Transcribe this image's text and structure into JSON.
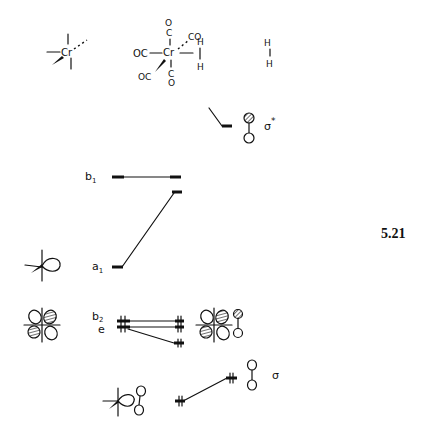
{
  "figure": {
    "number": "5.21"
  },
  "fragments": {
    "left": {
      "name": "Cr(CO)5 fragment",
      "metal_label": "Cr"
    },
    "complex": {
      "metal_label": "Cr",
      "ligands": {
        "top": [
          "O",
          "C"
        ],
        "left": "OC",
        "upper_right": "CO",
        "lower_left": "OC",
        "bottom": [
          "C",
          "O"
        ],
        "h_top": "H",
        "h_bottom": "H"
      }
    },
    "right": {
      "name": "H2",
      "atoms": [
        "H",
        "H"
      ]
    }
  },
  "levels": {
    "sigma_star": {
      "label": "σ",
      "superscript": "*"
    },
    "b1": {
      "label": "b",
      "subscript": "1"
    },
    "a1": {
      "label": "a",
      "subscript": "1"
    },
    "b2": {
      "label": "b",
      "subscript": "2"
    },
    "e": {
      "label": "e"
    },
    "sigma": {
      "label": "σ"
    }
  }
}
